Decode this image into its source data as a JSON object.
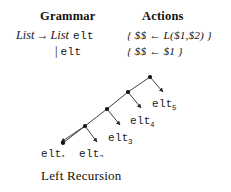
{
  "figure": {
    "caption": "Left Recursion"
  },
  "table": {
    "headers": {
      "grammar": "Grammar",
      "actions": "Actions"
    },
    "rows": [
      {
        "grammar": {
          "lhs": "List",
          "arrow": "→",
          "rhs_nonterminal": "List",
          "rhs_terminal": "elt"
        },
        "action": "{ $$ ← L($1,$2) }"
      },
      {
        "grammar": {
          "alt_bar": "|",
          "rhs_terminal": "elt"
        },
        "action": "{ $$ ← $1 }"
      }
    ]
  },
  "tree": {
    "description": "left-recursive parse tree",
    "nodes": [
      {
        "id": "n5",
        "x": 150,
        "y": 15
      },
      {
        "id": "n4",
        "x": 128,
        "y": 30
      },
      {
        "id": "n3",
        "x": 107,
        "y": 47
      },
      {
        "id": "n2",
        "x": 85,
        "y": 64
      },
      {
        "id": "n1",
        "x": 63,
        "y": 81
      }
    ],
    "leaf_labels": [
      {
        "base": "elt",
        "sub": "1",
        "x": 41,
        "y": 95
      },
      {
        "base": "elt",
        "sub": "2",
        "x": 79,
        "y": 95
      },
      {
        "base": "elt",
        "sub": "3",
        "x": 108,
        "y": 79
      },
      {
        "base": "elt",
        "sub": "4",
        "x": 130,
        "y": 62
      },
      {
        "base": "elt",
        "sub": "5",
        "x": 152,
        "y": 45
      }
    ],
    "stroke_color": "#2b2b2b",
    "node_color": "#111111"
  }
}
